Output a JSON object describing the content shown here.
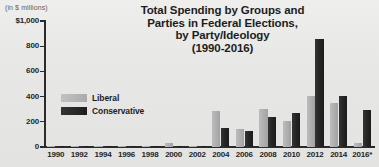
{
  "chart_data": {
    "type": "bar",
    "title": "Total Spending by Groups and Parties in Federal Elections, by Party/Ideology (1990-2016)",
    "title_lines": [
      "Total Spending by Groups and",
      "Parties in Federal Elections,",
      "by Party/Ideology",
      "(1990-2016)"
    ],
    "units_label": "(in $ millions)",
    "xlabel": "",
    "ylabel": "",
    "ylim": [
      0,
      1000
    ],
    "yticks": [
      0,
      200,
      400,
      600,
      800,
      1000
    ],
    "ytick_labels": [
      "0",
      "200",
      "400",
      "600",
      "800",
      "$1,000"
    ],
    "grid": false,
    "legend_position": "inside-left",
    "categories": [
      "1990",
      "1992",
      "1994",
      "1996",
      "1998",
      "2000",
      "2002",
      "2004",
      "2006",
      "2008",
      "2010",
      "2012",
      "2014",
      "2016*"
    ],
    "series": [
      {
        "name": "Liberal",
        "color": "#aeaeae",
        "values": [
          2,
          3,
          2,
          4,
          3,
          28,
          5,
          288,
          140,
          305,
          208,
          405,
          352,
          30
        ]
      },
      {
        "name": "Conservative",
        "color": "#242424",
        "values": [
          2,
          3,
          2,
          3,
          2,
          8,
          4,
          152,
          130,
          235,
          268,
          855,
          405,
          295
        ]
      }
    ],
    "annotations": [
      "2016 figures marked with an asterisk"
    ]
  },
  "legend": {
    "items": [
      {
        "label": "Liberal",
        "swatch": "liberal-swatch"
      },
      {
        "label": "Conservative",
        "swatch": "conservative-swatch"
      }
    ]
  }
}
